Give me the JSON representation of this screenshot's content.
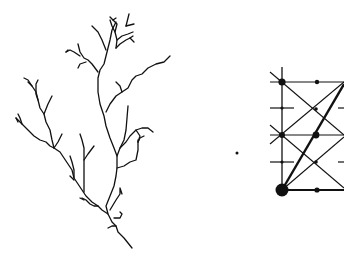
{
  "figure": {
    "background": "#ffffff",
    "stroke_color": "#111111",
    "panels": [
      {
        "name": "branching-tree",
        "description": "Fractal river/tree branching pattern"
      },
      {
        "name": "lattice-graph",
        "description": "Lattice of lines with weighted nodes, partially cropped at right edge"
      }
    ],
    "isolated_dot": {
      "x": 237,
      "y": 153
    }
  }
}
